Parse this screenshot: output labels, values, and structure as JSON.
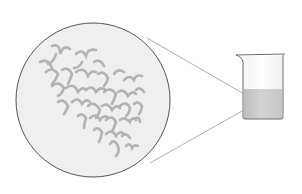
{
  "diagram": {
    "type": "magnified-view",
    "colors": {
      "background": "#ffffff",
      "magnifier_fill": "#efefef",
      "magnifier_stroke": "#555555",
      "particle": "#b3b3b3",
      "leader_line": "#9a9a9a",
      "beaker_stroke": "#6e6e6e",
      "beaker_glass": "#f7f7f7",
      "liquid": "#c2c2c2"
    },
    "magnifier": {
      "cx": 93,
      "cy": 100,
      "r": 77
    },
    "beaker": {
      "left": 243,
      "right": 283,
      "top": 54,
      "bottom": 119,
      "liquid_top": 89
    },
    "focus_point": {
      "x": 258,
      "y": 102
    },
    "icons": [
      "magnifier-circle-icon",
      "beaker-icon",
      "particle-strand-icon"
    ]
  }
}
